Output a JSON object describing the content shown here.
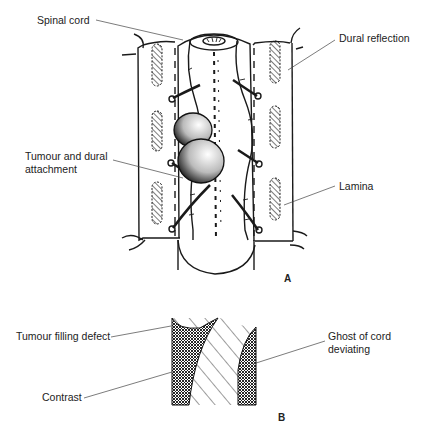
{
  "figure": {
    "panel_a": {
      "letter": "A",
      "labels": {
        "spinal_cord": "Spinal cord",
        "dural_reflection": "Dural reflection",
        "tumour_attachment": "Tumour and dural\nattachment",
        "lamina": "Lamina"
      }
    },
    "panel_b": {
      "letter": "B",
      "labels": {
        "filling_defect": "Tumour filling defect",
        "contrast": "Contrast",
        "ghost_cord": "Ghost of cord\ndeviating"
      }
    }
  }
}
